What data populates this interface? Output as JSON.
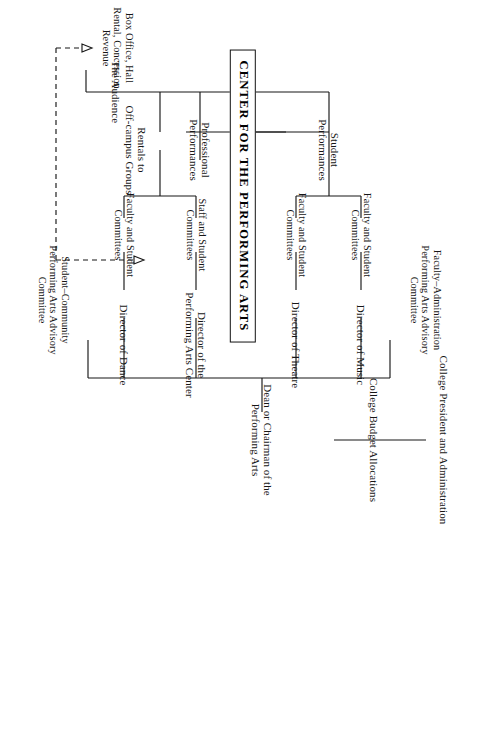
{
  "diagram": {
    "orientation": "rotated-90",
    "center": {
      "label": "Center for the Performing Arts"
    },
    "nodes": {
      "college_president": "College President and Administration",
      "budget_allocations": "College Budget Allocations",
      "dean": "Dean or Chairman of the\nPerforming Arts",
      "student_community_committee": "Student–Community\nPerforming Arts Advisory\nCommittee",
      "faculty_admin_committee": "Faculty–Administration\nPerforming Arts Advisory\nCommittee",
      "director_music": "Director of Music",
      "director_theatre": "Director of Theatre",
      "director_pac": "Director of the\nPerforming Arts Center",
      "director_dance": "Director of Dance",
      "committee_music": "Faculty and Student\nCommittees",
      "committee_theatre": "Faculty and Student\nCommittees",
      "committee_pac": "Staff and Student\nCommittees",
      "committee_dance": "Faculty and Student\nCommittees",
      "student_performances": "Student\nPerformances",
      "professional_performances": "Professional\nPerformances",
      "rentals": "Rentals to\nOff-campus Groups",
      "audience": "The Audience",
      "revenue": "Box Office, Hall\nRental, Concession\nRevenue"
    },
    "colors": {
      "ink": "#171717",
      "background": "#ffffff",
      "box_border": "#111111"
    }
  }
}
